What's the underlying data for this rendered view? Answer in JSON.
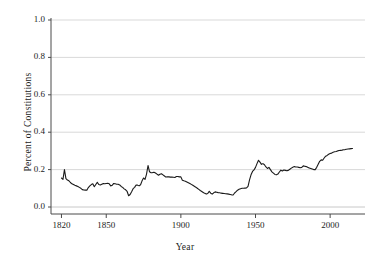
{
  "chart_data": {
    "type": "line",
    "title": "",
    "subtitle": "",
    "xlabel": "Year",
    "ylabel": "Percent of Constitutions",
    "xlim": [
      1815,
      2018
    ],
    "ylim": [
      0.0,
      1.0
    ],
    "xticks": [
      1820,
      1850,
      1900,
      1950,
      2000
    ],
    "xtick_labels": [
      "1820",
      "1850",
      "1900",
      "1950",
      "2000"
    ],
    "yticks": [
      0.0,
      0.2,
      0.4,
      0.6,
      0.8,
      1.0
    ],
    "ytick_labels": [
      "0.0",
      "0.2",
      "0.4",
      "0.6",
      "0.8",
      "1.0"
    ],
    "grid": "horizontal",
    "legend": "none",
    "line_color": "#1a1a1a",
    "grid_color": "#c8c8c8",
    "axis_color": "#4a4a4a",
    "background": "#ffffff",
    "series": [
      {
        "name": "Percent of Constitutions",
        "x": [
          1820,
          1821,
          1822,
          1823,
          1824,
          1825,
          1826,
          1827,
          1828,
          1829,
          1830,
          1831,
          1832,
          1833,
          1834,
          1835,
          1836,
          1837,
          1838,
          1839,
          1840,
          1841,
          1842,
          1843,
          1844,
          1845,
          1846,
          1847,
          1848,
          1849,
          1850,
          1851,
          1852,
          1853,
          1854,
          1855,
          1856,
          1857,
          1858,
          1859,
          1860,
          1861,
          1862,
          1863,
          1864,
          1865,
          1866,
          1867,
          1868,
          1869,
          1870,
          1871,
          1872,
          1873,
          1874,
          1875,
          1876,
          1877,
          1878,
          1879,
          1880,
          1881,
          1882,
          1883,
          1884,
          1885,
          1886,
          1887,
          1888,
          1889,
          1890,
          1891,
          1892,
          1893,
          1894,
          1895,
          1896,
          1897,
          1898,
          1899,
          1900,
          1901,
          1902,
          1903,
          1904,
          1905,
          1906,
          1907,
          1908,
          1909,
          1910,
          1911,
          1912,
          1913,
          1914,
          1915,
          1916,
          1917,
          1918,
          1919,
          1920,
          1921,
          1922,
          1923,
          1924,
          1925,
          1926,
          1927,
          1928,
          1929,
          1930,
          1931,
          1932,
          1933,
          1934,
          1935,
          1936,
          1937,
          1938,
          1939,
          1940,
          1941,
          1942,
          1943,
          1944,
          1945,
          1946,
          1947,
          1948,
          1949,
          1950,
          1951,
          1952,
          1953,
          1954,
          1955,
          1956,
          1957,
          1958,
          1959,
          1960,
          1961,
          1962,
          1963,
          1964,
          1965,
          1966,
          1967,
          1968,
          1969,
          1970,
          1971,
          1972,
          1973,
          1974,
          1975,
          1976,
          1977,
          1978,
          1979,
          1980,
          1981,
          1982,
          1983,
          1984,
          1985,
          1986,
          1987,
          1988,
          1989,
          1990,
          1991,
          1992,
          1993,
          1994,
          1995,
          1996,
          1997,
          1998,
          1999,
          2000,
          2001,
          2002,
          2003,
          2004,
          2005,
          2006,
          2007,
          2008,
          2009,
          2010,
          2011,
          2012,
          2013,
          2014,
          2015
        ],
        "y": [
          0.155,
          0.148,
          0.2,
          0.152,
          0.144,
          0.14,
          0.131,
          0.124,
          0.12,
          0.116,
          0.113,
          0.11,
          0.105,
          0.1,
          0.093,
          0.091,
          0.09,
          0.09,
          0.104,
          0.113,
          0.12,
          0.124,
          0.108,
          0.12,
          0.132,
          0.12,
          0.118,
          0.122,
          0.125,
          0.124,
          0.126,
          0.127,
          0.124,
          0.113,
          0.116,
          0.126,
          0.124,
          0.122,
          0.122,
          0.118,
          0.11,
          0.105,
          0.097,
          0.092,
          0.083,
          0.06,
          0.067,
          0.082,
          0.098,
          0.105,
          0.118,
          0.117,
          0.113,
          0.119,
          0.14,
          0.155,
          0.148,
          0.176,
          0.222,
          0.188,
          0.183,
          0.184,
          0.186,
          0.182,
          0.176,
          0.17,
          0.175,
          0.178,
          0.172,
          0.166,
          0.16,
          0.162,
          0.161,
          0.16,
          0.16,
          0.159,
          0.158,
          0.163,
          0.163,
          0.161,
          0.161,
          0.143,
          0.14,
          0.138,
          0.134,
          0.13,
          0.126,
          0.121,
          0.116,
          0.111,
          0.106,
          0.1,
          0.094,
          0.088,
          0.083,
          0.078,
          0.073,
          0.069,
          0.072,
          0.084,
          0.074,
          0.069,
          0.076,
          0.081,
          0.079,
          0.077,
          0.076,
          0.074,
          0.073,
          0.072,
          0.071,
          0.07,
          0.069,
          0.067,
          0.065,
          0.064,
          0.075,
          0.082,
          0.09,
          0.095,
          0.098,
          0.1,
          0.1,
          0.101,
          0.102,
          0.11,
          0.145,
          0.172,
          0.19,
          0.198,
          0.212,
          0.232,
          0.25,
          0.24,
          0.228,
          0.232,
          0.226,
          0.214,
          0.206,
          0.212,
          0.2,
          0.188,
          0.181,
          0.174,
          0.172,
          0.176,
          0.187,
          0.197,
          0.193,
          0.198,
          0.196,
          0.194,
          0.196,
          0.202,
          0.208,
          0.213,
          0.216,
          0.214,
          0.214,
          0.212,
          0.21,
          0.212,
          0.22,
          0.218,
          0.216,
          0.212,
          0.209,
          0.206,
          0.203,
          0.2,
          0.2,
          0.212,
          0.228,
          0.244,
          0.252,
          0.25,
          0.262,
          0.272,
          0.276,
          0.282,
          0.286,
          0.288,
          0.293,
          0.295,
          0.297,
          0.3,
          0.302,
          0.303,
          0.304,
          0.306,
          0.307,
          0.309,
          0.31,
          0.311,
          0.312,
          0.313
        ]
      }
    ]
  },
  "axes": {
    "ylabel": "Percent of Constitutions",
    "xlabel": "Year",
    "ytick_labels": [
      "1.0",
      "0.8",
      "0.6",
      "0.4",
      "0.2",
      "0.0"
    ],
    "xtick_labels": [
      "1820",
      "1850",
      "1900",
      "1950",
      "2000"
    ]
  }
}
